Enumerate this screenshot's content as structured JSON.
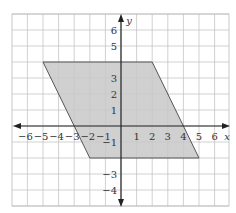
{
  "diagram": {
    "type": "coordinate-plane",
    "x_axis_label": "x",
    "y_axis_label": "y",
    "x_ticks": [
      "−6",
      "−5",
      "−4",
      "−3",
      "−2",
      "−1",
      "1",
      "2",
      "3",
      "4",
      "5",
      "6"
    ],
    "y_ticks": [
      "6",
      "5",
      "3",
      "2",
      "1",
      "−1",
      "−3",
      "−4"
    ],
    "shape": {
      "name": "parallelogram",
      "vertices": [
        [
          -5,
          4
        ],
        [
          2,
          4
        ],
        [
          5,
          -2
        ],
        [
          -2,
          -2
        ]
      ],
      "fill": "#c8c8c8",
      "stroke": "#555555"
    },
    "grid_range": {
      "x": [
        -7,
        7
      ],
      "y": [
        -5,
        7
      ]
    }
  }
}
